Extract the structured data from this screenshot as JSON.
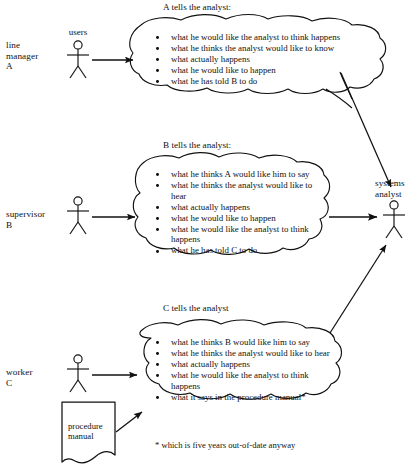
{
  "diagram": {
    "ink_color": "#111111",
    "background": "#ffffff"
  },
  "actors": [
    {
      "id": "a",
      "role_line1": "line",
      "role_line2": "manager",
      "role_line3": "A",
      "caption": "users",
      "icon": "stick-figure-icon"
    },
    {
      "id": "b",
      "role_line1": "supervisor",
      "role_line2": "B",
      "role_line3": "",
      "caption": "",
      "icon": "stick-figure-icon"
    },
    {
      "id": "c",
      "role_line1": "worker",
      "role_line2": "C",
      "role_line3": "",
      "caption": "",
      "icon": "stick-figure-icon"
    }
  ],
  "target": {
    "label_line1": "systems",
    "label_line2": "analyst",
    "icon": "stick-figure-icon"
  },
  "clouds": [
    {
      "id": "cloud-a",
      "heading": "A tells the analyst:",
      "items": [
        "what he would like the analyst to think happens",
        "what he thinks the analyst would like to know",
        "what actually happens",
        "what he would like to happen",
        "what he has told B to do"
      ]
    },
    {
      "id": "cloud-b",
      "heading": "B tells the analyst:",
      "items": [
        "what he thinks A would like him to say",
        "what he thinks the analyst would like to hear",
        "what actually happens",
        "what he would like to happen",
        "what he would like the analyst to think happens",
        "what he has told C to do"
      ]
    },
    {
      "id": "cloud-c",
      "heading": "C tells the analyst",
      "items": [
        "what he thinks B would like him to say",
        "what he thinks the analyst would like to hear",
        "what actually happens",
        "what he would like the analyst to think happens",
        "what it says in the procedure manual*"
      ]
    }
  ],
  "document": {
    "line1": "procedure",
    "line2": "manual",
    "icon": "document-icon"
  },
  "footnote": {
    "text": "* which is five years out-of-date anyway"
  }
}
